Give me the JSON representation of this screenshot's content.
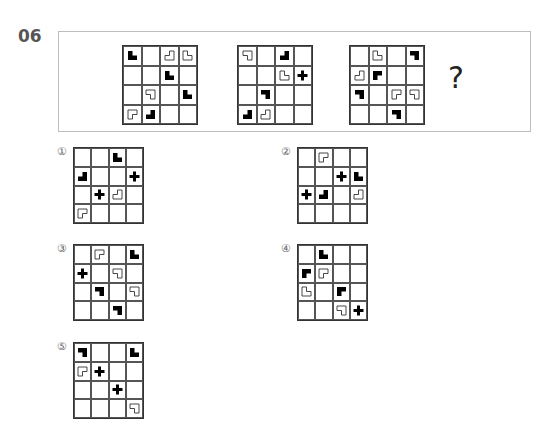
{
  "question": {
    "number": "06",
    "answer_placeholder": "?",
    "sequence": [
      {
        "label": "grid-1",
        "cells": [
          [
            "black-tr",
            "",
            "white-tl",
            "white-tr"
          ],
          [
            "",
            "",
            "black-tr",
            ""
          ],
          [
            "",
            "white-bl",
            "",
            "black-tr"
          ],
          [
            "white-br",
            "black-tl",
            "",
            ""
          ]
        ]
      },
      {
        "label": "grid-2",
        "cells": [
          [
            "white-bl",
            "",
            "black-tl",
            ""
          ],
          [
            "",
            "",
            "white-tr",
            "plus"
          ],
          [
            "",
            "black-bl",
            "",
            ""
          ],
          [
            "black-tl",
            "white-tl",
            "",
            ""
          ]
        ]
      },
      {
        "label": "grid-3",
        "cells": [
          [
            "",
            "white-tr",
            "",
            "black-bl"
          ],
          [
            "white-tl",
            "black-br",
            "",
            ""
          ],
          [
            "black-bl",
            "",
            "white-br",
            "white-bl"
          ],
          [
            "",
            "",
            "black-bl",
            ""
          ]
        ]
      }
    ]
  },
  "options": [
    {
      "label": "①",
      "cells": [
        [
          "",
          "",
          "black-tr",
          ""
        ],
        [
          "black-tl",
          "",
          "",
          "plus"
        ],
        [
          "",
          "plus",
          "white-tl",
          ""
        ],
        [
          "white-br",
          "",
          "",
          ""
        ]
      ]
    },
    {
      "label": "②",
      "cells": [
        [
          "",
          "white-br",
          "",
          ""
        ],
        [
          "",
          "",
          "plus",
          "black-tr"
        ],
        [
          "plus",
          "black-tl",
          "",
          "white-tl"
        ],
        [
          "",
          "",
          "",
          ""
        ]
      ]
    },
    {
      "label": "③",
      "cells": [
        [
          "",
          "white-br",
          "",
          "black-tr"
        ],
        [
          "plus",
          "",
          "white-bl",
          ""
        ],
        [
          "",
          "black-bl",
          "",
          "white-bl"
        ],
        [
          "",
          "",
          "black-bl",
          ""
        ]
      ]
    },
    {
      "label": "④",
      "cells": [
        [
          "",
          "black-tr",
          "",
          ""
        ],
        [
          "black-br",
          "white-br",
          "",
          ""
        ],
        [
          "white-tr",
          "",
          "black-br",
          ""
        ],
        [
          "",
          "",
          "white-bl",
          "plus"
        ]
      ]
    },
    {
      "label": "⑤",
      "cells": [
        [
          "black-bl",
          "",
          "",
          "black-tr"
        ],
        [
          "white-br",
          "plus",
          "",
          ""
        ],
        [
          "",
          "",
          "plus",
          ""
        ],
        [
          "",
          "",
          "",
          "white-bl"
        ]
      ]
    }
  ],
  "legend": {
    "black-tr": "solid L-shape, notch top-right",
    "black-tl": "solid L-shape, notch top-left",
    "black-bl": "solid L-shape, notch bottom-left",
    "black-br": "solid L-shape, notch bottom-right",
    "white-tr": "outlined L-shape, notch top-right",
    "white-tl": "outlined L-shape, notch top-left",
    "white-bl": "outlined L-shape, notch bottom-left",
    "white-br": "outlined L-shape, notch bottom-right",
    "plus": "solid plus sign"
  },
  "colors": {
    "shape_fill": "#000000",
    "grid_line": "#555555",
    "box_border": "#bdbdbd",
    "number_text": "#555555"
  }
}
